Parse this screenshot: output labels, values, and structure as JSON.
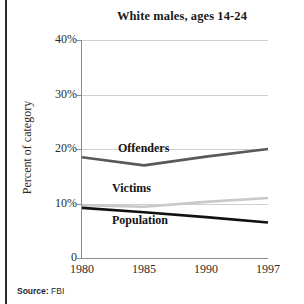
{
  "figure": {
    "title": "White males, ages 14-24",
    "source_label": "Source:",
    "source_value": "FBI"
  },
  "chart_data": {
    "type": "line",
    "title": "White males, ages 14-24",
    "xlabel": "",
    "ylabel": "Percent of category",
    "x": [
      1980,
      1985,
      1990,
      1997
    ],
    "xtick_labels": [
      "1980",
      "1985",
      "1990",
      "1997"
    ],
    "ytick_labels": [
      "0",
      "10%",
      "20%",
      "30%",
      "40%"
    ],
    "ytick_values": [
      0,
      10,
      20,
      30,
      40
    ],
    "ylim": [
      0,
      40
    ],
    "grid": "horizontal",
    "legend": "inline-labels",
    "series": [
      {
        "name": "Offenders",
        "color": "#595959",
        "values": [
          18.5,
          17.0,
          18.6,
          20.0
        ]
      },
      {
        "name": "Victims",
        "color": "#c9c9c9",
        "values": [
          9.7,
          9.4,
          10.3,
          11.0
        ]
      },
      {
        "name": "Population",
        "color": "#111111",
        "values": [
          9.2,
          8.4,
          7.5,
          6.5
        ]
      }
    ]
  },
  "axis": {
    "ticks_y": [
      {
        "label": "40%",
        "value": 40
      },
      {
        "label": "30%",
        "value": 30
      },
      {
        "label": "20%",
        "value": 20
      },
      {
        "label": "10%",
        "value": 10
      },
      {
        "label": "0",
        "value": 0
      }
    ],
    "ticks_x": [
      {
        "label": "1980",
        "value": 1980
      },
      {
        "label": "1985",
        "value": 1985
      },
      {
        "label": "1990",
        "value": 1990
      },
      {
        "label": "1997",
        "value": 1997
      }
    ]
  }
}
